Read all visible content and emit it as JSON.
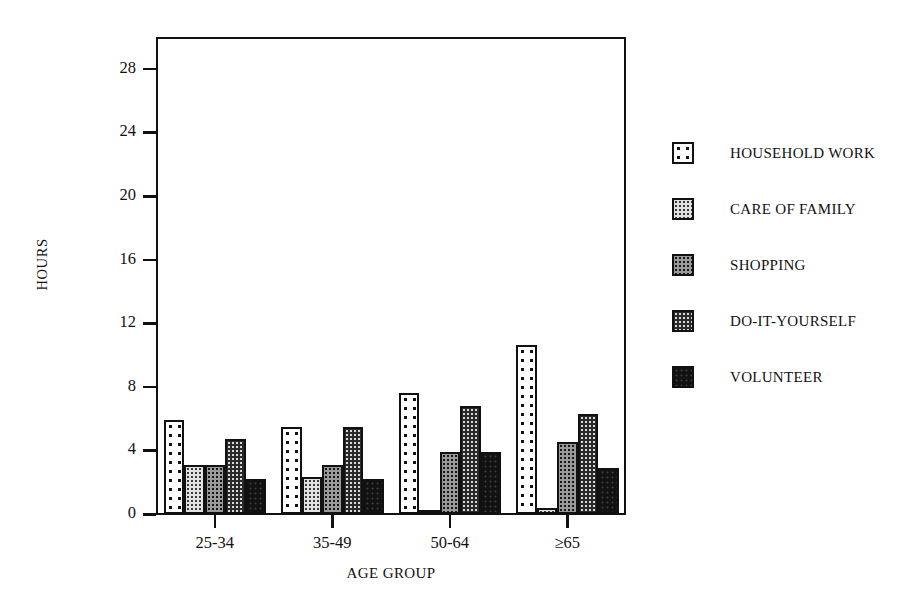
{
  "chart_data": {
    "type": "bar",
    "title": "",
    "subtitle": "",
    "xlabel": "AGE GROUP",
    "ylabel": "HOURS",
    "categories": [
      "25-34",
      "35-49",
      "50-64",
      "≥65"
    ],
    "ylim": [
      0,
      30
    ],
    "yticks": [
      0,
      4,
      8,
      12,
      16,
      20,
      24,
      28
    ],
    "ytick_labels": [
      "0",
      "4",
      "8",
      "12",
      "16",
      "20",
      "24",
      "28"
    ],
    "grid": false,
    "legend_position": "right",
    "series": [
      {
        "name": "HOUSEHOLD WORK",
        "pattern": "sparse-dots",
        "values": [
          5.9,
          5.5,
          7.6,
          10.6
        ]
      },
      {
        "name": "CARE OF FAMILY",
        "pattern": "light-stipple",
        "values": [
          3.1,
          2.3,
          0.25,
          0.4
        ]
      },
      {
        "name": "SHOPPING",
        "pattern": "grey-stipple",
        "values": [
          3.1,
          3.1,
          3.9,
          4.5
        ]
      },
      {
        "name": "DO-IT-YOURSELF",
        "pattern": "dark-stipple",
        "values": [
          4.7,
          5.5,
          6.8,
          6.3
        ]
      },
      {
        "name": "VOLUNTEER",
        "pattern": "solid-black",
        "values": [
          2.2,
          2.2,
          3.9,
          2.9
        ]
      }
    ]
  },
  "axes": {
    "y_title": "HOURS",
    "x_title": "AGE GROUP"
  },
  "legend": {
    "items": [
      {
        "label": "HOUSEHOLD WORK"
      },
      {
        "label": "CARE OF FAMILY"
      },
      {
        "label": "SHOPPING"
      },
      {
        "label": "DO-IT-YOURSELF"
      },
      {
        "label": "VOLUNTEER"
      }
    ]
  },
  "colors": {
    "ink": "#111111",
    "background": "#ffffff"
  }
}
